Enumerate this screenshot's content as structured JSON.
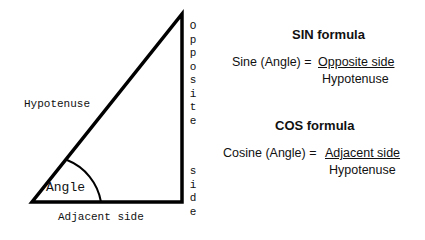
{
  "diagram": {
    "triangle": {
      "vertices": {
        "bottom_left": [
          32,
          202
        ],
        "bottom_right": [
          182,
          202
        ],
        "top": [
          182,
          14
        ]
      },
      "stroke_color": "#000000",
      "labels": {
        "hypotenuse": "Hypotenuse",
        "adjacent": "Adjacent side",
        "opposite_word": "Opposite",
        "side_word": "side",
        "angle": "Angle"
      },
      "opposite_letters": [
        "O",
        "p",
        "p",
        "o",
        "s",
        "i",
        "t",
        "e"
      ],
      "side_letters": [
        "s",
        "i",
        "d",
        "e"
      ]
    },
    "sin": {
      "title": "SIN  formula",
      "lhs": "Sine (Angle) =",
      "numerator": "Opposite side",
      "denominator": "Hypotenuse"
    },
    "cos": {
      "title": "COS formula",
      "lhs": "Cosine (Angle) =",
      "numerator": "Adjacent side",
      "denominator": "Hypotenuse"
    }
  }
}
